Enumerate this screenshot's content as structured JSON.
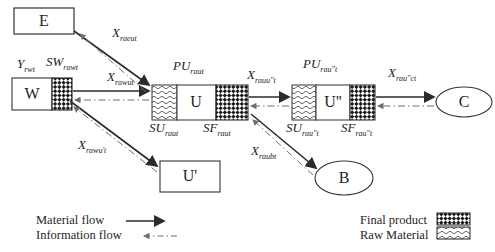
{
  "figure": {
    "nodes": {
      "E": {
        "label": "E"
      },
      "W": {
        "label": "W"
      },
      "U": {
        "label": "U"
      },
      "U1": {
        "label": "U'"
      },
      "U2": {
        "label": "U''"
      },
      "B": {
        "label": "B"
      },
      "C": {
        "label": "C"
      }
    },
    "labels": {
      "x_raeut": {
        "base": "X",
        "sub": "raeut"
      },
      "y_rwt": {
        "base": "Y",
        "sub": "rwt"
      },
      "sw_rawt": {
        "base": "SW",
        "sub": "rawt"
      },
      "x_rawut": {
        "base": "X",
        "sub": "rawut"
      },
      "x_rawu1t": {
        "base": "X",
        "sub": "rawu't"
      },
      "pu_raut": {
        "base": "PU",
        "sub": "raut"
      },
      "su_raut": {
        "base": "SU",
        "sub": "raut"
      },
      "sf_raut": {
        "base": "SF",
        "sub": "raut"
      },
      "x_rauu2t": {
        "base": "X",
        "sub": "rauu''t"
      },
      "pu_rau2t": {
        "base": "PU",
        "sub": "rau''t"
      },
      "su_rau2t": {
        "base": "SU",
        "sub": "rau''t"
      },
      "sf_rau2t": {
        "base": "SF",
        "sub": "rau''t"
      },
      "x_rau2ct": {
        "base": "X",
        "sub": "rau''ct"
      },
      "x_raubt": {
        "base": "X",
        "sub": "raubt"
      }
    },
    "legend": {
      "material_flow": "Material flow",
      "information_flow": "Information flow",
      "final_product": "Final product",
      "raw_material": "Raw Material"
    },
    "colors": {
      "stroke": "#2b2b2b",
      "info_flow": "#6f6f6f",
      "background": "#ffffff",
      "hatch": "#1a1a1a"
    }
  }
}
